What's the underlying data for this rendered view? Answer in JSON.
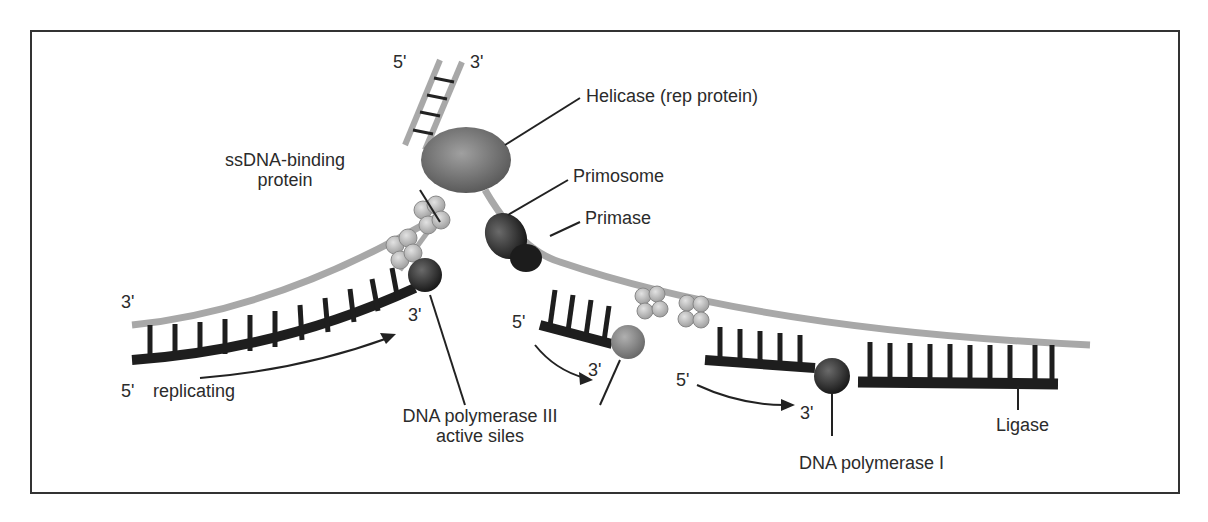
{
  "diagram": {
    "labels": {
      "top_5prime": "5'",
      "top_3prime": "3'",
      "helicase": "Helicase (rep protein)",
      "ssdna_line1": "ssDNA-binding",
      "ssdna_line2": "protein",
      "primosome": "Primosome",
      "primase": "Primase",
      "leading_3prime": "3'",
      "leading_5prime": "5'",
      "replicating": "replicating",
      "leading_new_3prime": "3'",
      "pol3_line1": "DNA polymerase III",
      "pol3_line2": "active siles",
      "okazaki1_5prime": "5'",
      "okazaki1_3prime": "3'",
      "okazaki2_5prime": "5'",
      "okazaki2_3prime": "3'",
      "pol1": "DNA polymerase I",
      "ligase": "Ligase"
    },
    "colors": {
      "template_strand": "#a8a8a8",
      "new_strand": "#1e1e1e",
      "helicase": "#7a7a7a",
      "primase": "#3a3a3a",
      "ssb": "#c8c8c8",
      "polymerase": "#2a2a2a",
      "pol3_lagging": "#8a8a8a"
    }
  }
}
